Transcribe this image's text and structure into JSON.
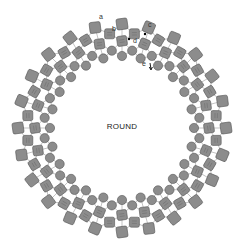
{
  "diagram": {
    "center_label": "ROUND",
    "center": [
      122,
      128
    ],
    "colors": {
      "bead_fill": "#8c8c8c",
      "bead_stroke": "#555555",
      "thread": "#9a9a9a",
      "hole": "#6a6a6a",
      "background": "#ffffff"
    },
    "rings": {
      "columns": 24,
      "outer_square": {
        "radius": 104,
        "size": 11,
        "kind": "square"
      },
      "middle_square_a": {
        "radius": 87,
        "size": 10,
        "kind": "two-hole-square"
      },
      "middle_square_b": {
        "radius": 95,
        "size": 10,
        "kind": "two-hole-square",
        "offset": 0.5
      },
      "inner_circle_a": {
        "radius": 72,
        "r": 4.6,
        "kind": "round-bead"
      },
      "inner_circle_b": {
        "radius": 78,
        "r": 4.6,
        "kind": "round-bead",
        "offset": 0.5
      }
    },
    "annotations": [
      {
        "label": "a",
        "x": 99,
        "y": 13
      },
      {
        "label": "b",
        "x": 112,
        "y": 25
      },
      {
        "label": "c",
        "x": 148,
        "y": 21
      },
      {
        "label": "d",
        "x": 133,
        "y": 37
      },
      {
        "label": "e",
        "x": 142,
        "y": 60
      }
    ]
  }
}
